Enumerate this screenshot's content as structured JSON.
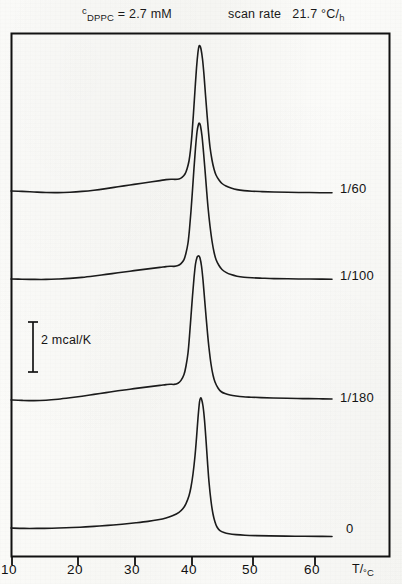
{
  "header": {
    "concentration_prefix": "c",
    "concentration_subscript": "DPPC",
    "concentration_value": "= 2.7 mM",
    "scan_rate_label": "scan rate",
    "scan_rate_value": "21.7 °C/h",
    "scan_rate_value_main": "21.7 °C/",
    "scan_rate_value_sub": "h"
  },
  "annotations": {
    "scalebar_label": "2 mcal/K",
    "scalebar_value": 2,
    "scalebar_units": "mcal/K"
  },
  "chart_data": {
    "type": "line",
    "xlabel": "T/°C",
    "ylabel": "heat capacity (mcal/K)",
    "xlim": [
      8.2,
      64.5
    ],
    "ylim": [
      0,
      1
    ],
    "grid": false,
    "legend_position": "right-inline",
    "x_ticks": [
      10,
      20,
      30,
      40,
      50,
      60
    ],
    "x_tick_labels": [
      "10",
      "20",
      "30",
      "40",
      "50",
      "60"
    ],
    "axis_title": "T/°C",
    "axis_title_main": "T/",
    "axis_title_sub": "°C",
    "scalebar": {
      "label": "2 mcal/K",
      "value": 2,
      "units": "mcal/K",
      "x": 33,
      "y_top": 322,
      "y_bottom": 372
    },
    "series": [
      {
        "name": "1/60",
        "label": "1/60",
        "label_x": 340,
        "label_y": 181,
        "baseline_y": 190,
        "peak_temp": 41.0,
        "peak_y": 46,
        "pretransition_temp": 35.0,
        "points": [
          [
            11,
            191
          ],
          [
            22,
            191.4
          ],
          [
            34,
            192
          ],
          [
            46,
            192.5
          ],
          [
            58,
            192.6
          ],
          [
            70,
            192.2
          ],
          [
            82,
            191.4
          ],
          [
            94,
            190.2
          ],
          [
            106,
            188.6
          ],
          [
            118,
            186.8
          ],
          [
            130,
            185.0
          ],
          [
            142,
            183.2
          ],
          [
            152,
            181.8
          ],
          [
            160,
            180.6
          ],
          [
            166,
            179.6
          ],
          [
            171,
            179.2
          ],
          [
            175,
            179.4
          ],
          [
            179,
            179.0
          ],
          [
            182,
            177.4
          ],
          [
            185,
            174.0
          ],
          [
            187,
            169.0
          ],
          [
            189,
            161.0
          ],
          [
            190.5,
            150.0
          ],
          [
            192,
            134.0
          ],
          [
            193.5,
            113.0
          ],
          [
            195,
            90.0
          ],
          [
            196.5,
            68.0
          ],
          [
            198,
            52.0
          ],
          [
            199,
            46.2
          ],
          [
            200,
            46.0
          ],
          [
            201,
            49.0
          ],
          [
            202.5,
            59.0
          ],
          [
            204,
            75.0
          ],
          [
            205.5,
            95.0
          ],
          [
            207,
            114.0
          ],
          [
            208.5,
            132.0
          ],
          [
            210,
            147.0
          ],
          [
            212,
            160.0
          ],
          [
            214,
            169.0
          ],
          [
            216,
            175.0
          ],
          [
            219,
            180.0
          ],
          [
            222,
            183.5
          ],
          [
            226,
            186.0
          ],
          [
            231,
            188.0
          ],
          [
            237,
            189.6
          ],
          [
            244,
            190.6
          ],
          [
            252,
            191.2
          ],
          [
            262,
            191.6
          ],
          [
            274,
            192.0
          ],
          [
            288,
            192.3
          ],
          [
            304,
            192.5
          ],
          [
            320,
            192.7
          ],
          [
            332,
            192.8
          ]
        ]
      },
      {
        "name": "1/100",
        "label": "1/100",
        "label_x": 340,
        "label_y": 268,
        "baseline_y": 277,
        "peak_temp": 41.0,
        "peak_y": 123,
        "pretransition_temp": 35.0,
        "points": [
          [
            11,
            279
          ],
          [
            22,
            279.2
          ],
          [
            34,
            279.4
          ],
          [
            46,
            279.4
          ],
          [
            58,
            279.0
          ],
          [
            70,
            278.4
          ],
          [
            82,
            277.4
          ],
          [
            94,
            276.0
          ],
          [
            106,
            274.4
          ],
          [
            118,
            272.8
          ],
          [
            130,
            271.2
          ],
          [
            142,
            269.6
          ],
          [
            152,
            268.4
          ],
          [
            160,
            267.4
          ],
          [
            166,
            266.6
          ],
          [
            170,
            266.2
          ],
          [
            174,
            266.4
          ],
          [
            178,
            265.6
          ],
          [
            181,
            263.6
          ],
          [
            184,
            259.6
          ],
          [
            186,
            253.0
          ],
          [
            188,
            243.0
          ],
          [
            189.5,
            229.0
          ],
          [
            191,
            211.0
          ],
          [
            192.5,
            190.0
          ],
          [
            194,
            168.0
          ],
          [
            195.5,
            148.0
          ],
          [
            197,
            132.0
          ],
          [
            198.5,
            124.2
          ],
          [
            199.5,
            123.4
          ],
          [
            200.5,
            126.0
          ],
          [
            202,
            136.0
          ],
          [
            203.5,
            152.0
          ],
          [
            205,
            170.0
          ],
          [
            206.5,
            189.0
          ],
          [
            208,
            207.0
          ],
          [
            210,
            226.0
          ],
          [
            212,
            241.0
          ],
          [
            214,
            252.0
          ],
          [
            216,
            259.5
          ],
          [
            219,
            265.5
          ],
          [
            222,
            269.5
          ],
          [
            226,
            272.4
          ],
          [
            231,
            274.6
          ],
          [
            237,
            276.2
          ],
          [
            244,
            277.2
          ],
          [
            252,
            277.8
          ],
          [
            262,
            278.2
          ],
          [
            274,
            278.6
          ],
          [
            288,
            278.8
          ],
          [
            304,
            279.0
          ],
          [
            320,
            279.1
          ],
          [
            332,
            279.2
          ]
        ]
      },
      {
        "name": "1/180",
        "label": "1/180",
        "label_x": 340,
        "label_y": 390,
        "baseline_y": 395,
        "peak_temp": 41.0,
        "peak_y": 256,
        "pretransition_temp": 35.0,
        "points": [
          [
            11,
            400
          ],
          [
            22,
            400.4
          ],
          [
            34,
            400.6
          ],
          [
            46,
            400.2
          ],
          [
            58,
            399.2
          ],
          [
            70,
            397.8
          ],
          [
            82,
            396.2
          ],
          [
            94,
            394.4
          ],
          [
            106,
            392.6
          ],
          [
            118,
            390.8
          ],
          [
            130,
            389.2
          ],
          [
            142,
            387.6
          ],
          [
            152,
            386.4
          ],
          [
            160,
            385.4
          ],
          [
            166,
            384.6
          ],
          [
            170,
            384.2
          ],
          [
            174,
            384.4
          ],
          [
            178,
            383.2
          ],
          [
            181,
            380.4
          ],
          [
            184,
            374.6
          ],
          [
            186,
            366.0
          ],
          [
            188,
            353.0
          ],
          [
            189.5,
            336.0
          ],
          [
            191,
            316.0
          ],
          [
            192.5,
            296.0
          ],
          [
            194,
            278.0
          ],
          [
            195.5,
            264.0
          ],
          [
            197,
            257.5
          ],
          [
            198,
            256.2
          ],
          [
            199,
            256.0
          ],
          [
            200,
            258.0
          ],
          [
            201.5,
            266.0
          ],
          [
            203,
            280.0
          ],
          [
            204.5,
            298.0
          ],
          [
            206,
            316.0
          ],
          [
            207.5,
            333.0
          ],
          [
            209,
            348.0
          ],
          [
            211,
            364.0
          ],
          [
            213,
            375.0
          ],
          [
            215,
            382.0
          ],
          [
            218,
            388.0
          ],
          [
            221,
            391.5
          ],
          [
            225,
            393.6
          ],
          [
            230,
            395.0
          ],
          [
            236,
            396.0
          ],
          [
            243,
            396.8
          ],
          [
            251,
            397.2
          ],
          [
            261,
            397.6
          ],
          [
            273,
            398.0
          ],
          [
            287,
            398.3
          ],
          [
            303,
            398.6
          ],
          [
            319,
            398.8
          ],
          [
            332,
            399.0
          ]
        ]
      },
      {
        "name": "0",
        "label": "0",
        "label_x": 346,
        "label_y": 521,
        "baseline_y": 528,
        "peak_temp": 41.2,
        "peak_y": 398,
        "pretransition_temp": null,
        "points": [
          [
            11,
            528
          ],
          [
            24,
            528.4
          ],
          [
            38,
            528.4
          ],
          [
            52,
            528.2
          ],
          [
            66,
            527.8
          ],
          [
            80,
            527.2
          ],
          [
            94,
            526.4
          ],
          [
            108,
            525.4
          ],
          [
            122,
            524.2
          ],
          [
            136,
            522.8
          ],
          [
            148,
            521.4
          ],
          [
            158,
            519.8
          ],
          [
            166,
            518.0
          ],
          [
            173,
            515.6
          ],
          [
            179,
            512.4
          ],
          [
            183,
            508.6
          ],
          [
            186,
            503.6
          ],
          [
            189,
            495.8
          ],
          [
            191,
            487.0
          ],
          [
            193,
            474.0
          ],
          [
            195,
            456.0
          ],
          [
            196.5,
            438.0
          ],
          [
            198,
            418.0
          ],
          [
            199.5,
            402.0
          ],
          [
            200.5,
            398.2
          ],
          [
            201.5,
            399.0
          ],
          [
            203,
            406.0
          ],
          [
            204.5,
            420.0
          ],
          [
            206,
            440.0
          ],
          [
            207.5,
            462.0
          ],
          [
            209,
            482.0
          ],
          [
            211,
            501.0
          ],
          [
            213,
            514.0
          ],
          [
            215,
            522.0
          ],
          [
            217,
            527.0
          ],
          [
            220,
            530.6
          ],
          [
            224,
            532.6
          ],
          [
            229,
            533.8
          ],
          [
            236,
            534.6
          ],
          [
            245,
            535.2
          ],
          [
            256,
            535.6
          ],
          [
            270,
            535.9
          ],
          [
            286,
            536.1
          ],
          [
            304,
            536.3
          ],
          [
            320,
            536.4
          ],
          [
            332,
            536.5
          ]
        ]
      }
    ]
  },
  "frame": {
    "left": 11,
    "top": 33,
    "right": 390,
    "bottom": 557
  }
}
